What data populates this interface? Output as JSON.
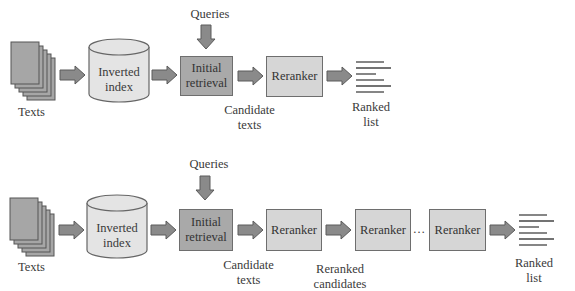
{
  "diagrams": [
    {
      "name": "single-stage-reranking",
      "texts_label": "Texts",
      "index_label_line1": "Inverted",
      "index_label_line2": "index",
      "queries_label": "Queries",
      "initial_retrieval_line1": "Initial",
      "initial_retrieval_line2": "retrieval",
      "candidate_line1": "Candidate",
      "candidate_line2": "texts",
      "reranker_label": "Reranker",
      "ranked_line1": "Ranked",
      "ranked_line2": "list"
    },
    {
      "name": "multi-stage-reranking",
      "texts_label": "Texts",
      "index_label_line1": "Inverted",
      "index_label_line2": "index",
      "queries_label": "Queries",
      "initial_retrieval_line1": "Initial",
      "initial_retrieval_line2": "retrieval",
      "candidate_line1": "Candidate",
      "candidate_line2": "texts",
      "reranker1_label": "Reranker",
      "reranker2_label": "Reranker",
      "ellipsis": "…",
      "reranker3_label": "Reranker",
      "reranked_line1": "Reranked",
      "reranked_line2": "candidates",
      "ranked_line1": "Ranked",
      "ranked_line2": "list"
    }
  ],
  "colors": {
    "arrow_fill": "#8a8a8a",
    "arrow_stroke": "#5a5a5a",
    "doc_fill": "#a6a6a6",
    "cylinder_fill": "#e4e4e4",
    "initial_box_fill": "#a9a9a9",
    "reranker_box_fill": "#d6d6d6",
    "list_line": "#444444"
  }
}
